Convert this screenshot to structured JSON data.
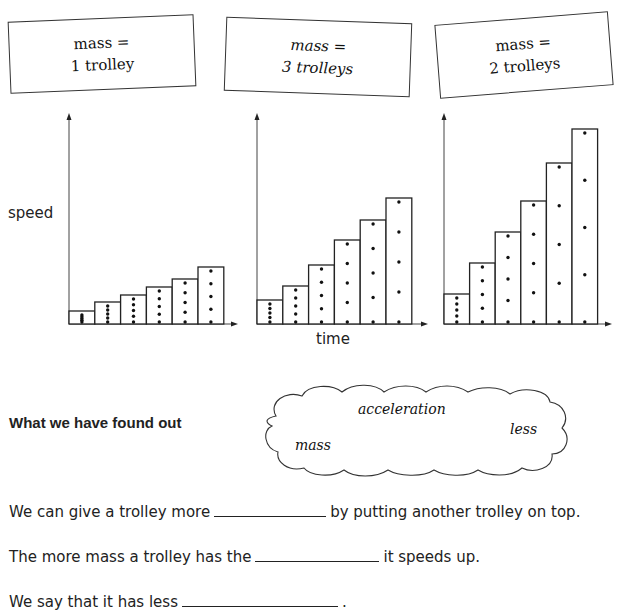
{
  "cards": [
    {
      "line1": "mass =",
      "line2": "1 trolley"
    },
    {
      "line1": "mass =",
      "line2": "3 trolleys"
    },
    {
      "line1": "mass =",
      "line2": "2 trolleys"
    }
  ],
  "axis": {
    "y_label": "speed",
    "x_label": "time"
  },
  "chart_data": [
    {
      "type": "bar",
      "title": "mass = 1 trolley",
      "xlabel": "time",
      "ylabel": "speed",
      "categories": [
        "1",
        "2",
        "3",
        "4",
        "5",
        "6"
      ],
      "values": [
        13,
        22,
        29,
        37,
        45,
        57
      ],
      "dots_per_bar": [
        5,
        5,
        5,
        5,
        5,
        5
      ],
      "grid": false
    },
    {
      "type": "bar",
      "title": "mass = 3 trolleys",
      "xlabel": "time",
      "ylabel": "speed",
      "categories": [
        "1",
        "2",
        "3",
        "4",
        "5",
        "6"
      ],
      "values": [
        24,
        38,
        59,
        84,
        104,
        126
      ],
      "dots_per_bar": [
        5,
        5,
        5,
        5,
        5,
        5
      ],
      "grid": false
    },
    {
      "type": "bar",
      "title": "mass = 2 trolleys",
      "xlabel": "time",
      "ylabel": "speed",
      "categories": [
        "1",
        "2",
        "3",
        "4",
        "5",
        "6"
      ],
      "values": [
        30,
        61,
        92,
        123,
        161,
        195
      ],
      "dots_per_bar": [
        5,
        5,
        5,
        5,
        5,
        5
      ],
      "grid": false
    }
  ],
  "found_out": {
    "heading": "What we have found out",
    "word_bank": [
      "acceleration",
      "less",
      "mass"
    ]
  },
  "sentences": [
    {
      "before": "We can give a trolley more",
      "after": "by putting another trolley on top."
    },
    {
      "before": "The more mass a trolley has the",
      "after": "it speeds up."
    },
    {
      "before": "We say that it has less",
      "after": "."
    }
  ]
}
